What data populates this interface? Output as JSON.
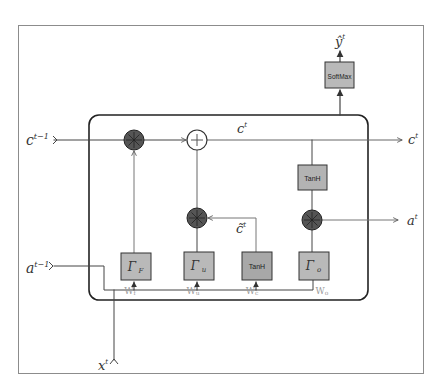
{
  "diagram": {
    "colors": {
      "frame": "#8c8c8c",
      "cell_border": "#222222",
      "gate_fill": "#b9b9b9",
      "tanh_gate_fill": "#a8a8a8",
      "op_dark_fill": "#555555",
      "line": "#444444",
      "light_line": "#888888"
    },
    "inputs": {
      "c_prev": {
        "base": "c",
        "sup": "t−1"
      },
      "a_prev": {
        "base": "a",
        "sup": "t−1"
      },
      "x_t": {
        "base": "x",
        "sup": "t"
      }
    },
    "outputs": {
      "c_t": {
        "base": "c",
        "sup": "t"
      },
      "a_t": {
        "base": "a",
        "sup": "t"
      },
      "y_hat": {
        "base": "ŷ",
        "sup": "t"
      }
    },
    "internal_labels": {
      "cell_state": {
        "base": "c",
        "sup": "t"
      },
      "candidate": {
        "base": "c̃",
        "sup": "t"
      }
    },
    "blocks": {
      "softmax": "SoftMax",
      "tanh_output": "TanH",
      "tanh_candidate": "TanH"
    },
    "gates": [
      {
        "id": "forget",
        "symbol": "Γ",
        "sub": "F",
        "weight": "W",
        "weight_sub": "f"
      },
      {
        "id": "update",
        "symbol": "Γ",
        "sub": "u",
        "weight": "W",
        "weight_sub": "u"
      },
      {
        "id": "candidate",
        "symbol": "TanH",
        "sub": "",
        "weight": "W",
        "weight_sub": "c"
      },
      {
        "id": "output",
        "symbol": "Γ",
        "sub": "o",
        "weight": "W",
        "weight_sub": "o"
      }
    ],
    "operators": {
      "multiply": "⊗",
      "add": "+"
    }
  }
}
